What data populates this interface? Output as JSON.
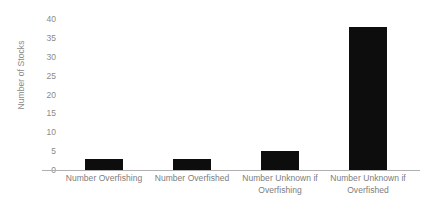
{
  "chart_data": {
    "type": "bar",
    "title": "",
    "xlabel": "",
    "ylabel": "Number of Stocks",
    "categories": [
      "Number Overfishing",
      "Number Overfished",
      "Number Unknown if Overfishing",
      "Number Unknown if Overfished"
    ],
    "values": [
      3,
      3,
      5,
      38
    ],
    "ylim": [
      0,
      40
    ],
    "yticks": [
      0,
      5,
      10,
      15,
      20,
      25,
      30,
      35,
      40
    ],
    "ytick_labels": [
      "0",
      "5",
      "10",
      "15",
      "20",
      "25",
      "30",
      "35",
      "40"
    ],
    "grid": false,
    "legend": false,
    "bar_color": "#0d0d0d",
    "axis_color": "#b0b0b0",
    "text_color": "#8a8a8a"
  }
}
